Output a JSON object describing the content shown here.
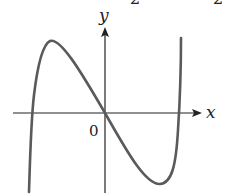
{
  "figure": {
    "type": "function-graph",
    "top_clipped_text": [
      "2",
      "2"
    ],
    "axes": {
      "x_label": "x",
      "y_label": "y",
      "origin_label": "0"
    },
    "colors": {
      "curve": "#5a5a5a",
      "axes": "#222222",
      "background": "#ffffff"
    },
    "curve_features": {
      "roots": [
        "negative root (left)",
        "0",
        "positive root (right)"
      ],
      "local_max": "left of y-axis, above x-axis",
      "local_min": "right of y-axis, below x-axis"
    }
  }
}
